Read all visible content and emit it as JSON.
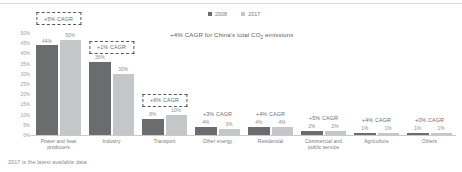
{
  "chart_data": {
    "type": "bar",
    "title": "",
    "xlabel": "",
    "ylabel": "",
    "ylim": [
      0,
      50
    ],
    "grid": false,
    "legend_position": "top-right",
    "ytick_labels": [
      "50%",
      "45%",
      "40%",
      "35%",
      "30%",
      "25%",
      "20%",
      "15%",
      "10%",
      "5%",
      "0%"
    ],
    "ytick_values": [
      50,
      45,
      40,
      35,
      30,
      25,
      20,
      15,
      10,
      5,
      0
    ],
    "categories": [
      "Power and heat producers",
      "Industry",
      "Transport",
      "Other energy",
      "Residential",
      "Commercial and public service",
      "Agriculture",
      "Others"
    ],
    "series": [
      {
        "name": "2008",
        "color": "#6b6c6e",
        "values": [
          44,
          36,
          8,
          4,
          4,
          2,
          1,
          1
        ]
      },
      {
        "name": "2017",
        "color": "#c4c6c8",
        "values": [
          50,
          30,
          10,
          3,
          4,
          2,
          1,
          1
        ]
      }
    ],
    "value_labels": {
      "2008": [
        "44%",
        "36%",
        "8%",
        "4%",
        "4%",
        "2%",
        "1%",
        "1%"
      ],
      "2017": [
        "50%",
        "30%",
        "10%",
        "3%",
        "4%",
        "2%",
        "1%",
        "1%"
      ]
    },
    "cagr_annotations": [
      {
        "label": "+5% CAGR",
        "boxed": true
      },
      {
        "label": "+1% CAGR",
        "boxed": true
      },
      {
        "label": "+6% CAGR",
        "boxed": true
      },
      {
        "label": "+3% CAGR",
        "boxed": false
      },
      {
        "label": "+4% CAGR",
        "boxed": false
      },
      {
        "label": "+5% CAGR",
        "boxed": false
      },
      {
        "label": "+4% CAGR",
        "boxed": false
      },
      {
        "label": "+0% CAGR",
        "boxed": false
      }
    ],
    "annotations": [
      "+4% CAGR for China's total CO2 emissions"
    ]
  },
  "legend": {
    "entries": [
      {
        "label": "2008",
        "color": "#6b6c6e"
      },
      {
        "label": "2017",
        "color": "#c4c6c8"
      }
    ]
  },
  "headline_note": {
    "prefix": "+4% CAGR for China's total CO",
    "subscript": "2",
    "suffix": " emissions"
  },
  "footnote": {
    "text": "2017 is the latest available data"
  },
  "colors": {
    "series_2008": "#6b6c6e",
    "series_2017": "#c4c6c8",
    "axis": "#c9cacb",
    "text": "#76787a",
    "dash_border": "#55585a"
  }
}
